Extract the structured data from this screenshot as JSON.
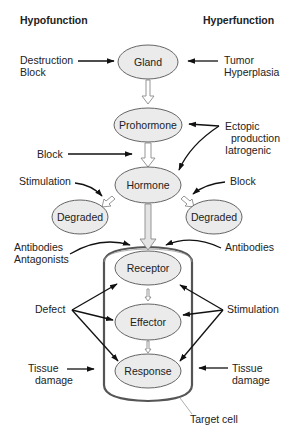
{
  "headers": {
    "left": "Hypofunction",
    "right": "Hyperfunction"
  },
  "nodes": {
    "gland": "Gland",
    "prohormone": "Prohormone",
    "hormone": "Hormone",
    "degraded_left": "Degraded",
    "degraded_right": "Degraded",
    "receptor": "Receptor",
    "effector": "Effector",
    "response": "Response"
  },
  "left_labels": {
    "destruction_block": [
      "Destruction",
      "Block"
    ],
    "block": "Block",
    "stimulation": "Stimulation",
    "antibodies_antagonists": [
      "Antibodies",
      "Antagonists"
    ],
    "defect": "Defect",
    "tissue_damage": [
      "Tissue",
      "damage"
    ]
  },
  "right_labels": {
    "tumor_hyperplasia": [
      "Tumor",
      "Hyperplasia"
    ],
    "ectopic": [
      "Ectopic",
      "production",
      "Iatrogenic"
    ],
    "block": "Block",
    "antibodies": "Antibodies",
    "stimulation": "Stimulation",
    "tissue_damage": [
      "Tissue",
      "damage"
    ]
  },
  "target_cell_label": "Target cell",
  "colors": {
    "node_fill": "#ebebeb",
    "node_stroke": "#555555",
    "cell_border": "#555555",
    "arrow": "#111111",
    "hollow_arrow": "#8a8a8a"
  }
}
